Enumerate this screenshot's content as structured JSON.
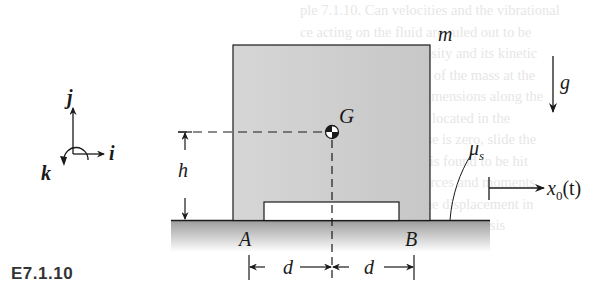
{
  "figure": {
    "caption": "E7.1.10",
    "labels": {
      "mass": "m",
      "gravity": "g",
      "center_of_mass": "G",
      "height": "h",
      "friction": "μ",
      "friction_sub": "s",
      "corner_a": "A",
      "corner_b": "B",
      "half_width_left": "d",
      "half_width_right": "d",
      "displacement": "x",
      "displacement_sub": "0",
      "displacement_arg": "(t)",
      "axis_i": "i",
      "axis_j": "j",
      "axis_k": "k"
    },
    "background_text_lines": [
      "ple 7.1.10. Can velocities and the vibrational",
      "ce acting on the fluid are ruled out to be",
      "ts using the fluid viscosity and its kinetic",
      "slowest and the inertia of the mass at the",
      "mass, vertical shape dimensions along the",
      "ly, the system must be located in the",
      "ing the block's response is zero, slide the",
      "nd the base, the block is found to be hit",
      "d and B, the normal forces and moments",
      "ion depends only on the displacement in",
      "ated from the block's force analysis",
      "ormation or rotation"
    ],
    "colors": {
      "block_fill": "#cfcfcf",
      "ground_fill_top": "#9a9a9a",
      "ground_fill_bottom": "#ffffff",
      "line": "#1a1a1a"
    }
  }
}
